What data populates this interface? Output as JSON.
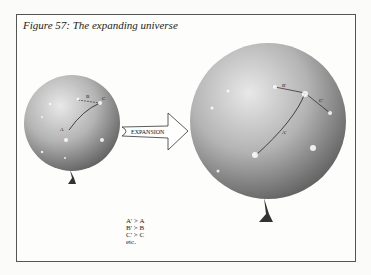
{
  "figure": {
    "title": "Figure 57: The expanding universe",
    "arrow_label": "EXPANSION",
    "small_balloon": {
      "labels": {
        "a": "A",
        "b": "B",
        "c": "C"
      }
    },
    "large_balloon": {
      "labels": {
        "a": "A'",
        "b": "B'",
        "c": "C'"
      }
    },
    "legend": [
      "A' > A",
      "B' > B",
      "C' > C",
      "etc."
    ]
  }
}
